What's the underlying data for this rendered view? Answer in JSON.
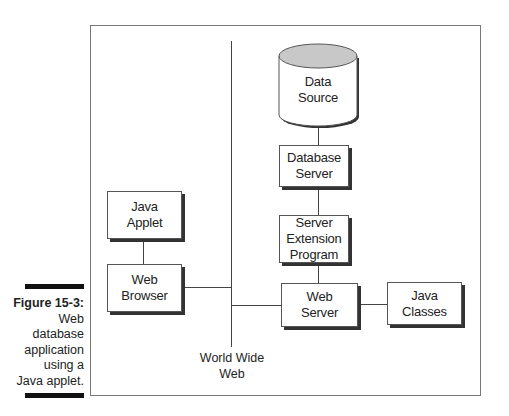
{
  "caption": {
    "label": "Figure 15-3:",
    "text": "Web\ndatabase\napplication\nusing a\nJava applet."
  },
  "diagram": {
    "nodes": {
      "data_source": "Data\nSource",
      "database_server": "Database\nServer",
      "server_extension": "Server\nExtension\nProgram",
      "java_applet": "Java\nApplet",
      "web_browser": "Web\nBrowser",
      "web_server": "Web\nServer",
      "java_classes": "Java\nClasses"
    },
    "www_label": "World Wide\nWeb",
    "connections": [
      [
        "data_source",
        "database_server"
      ],
      [
        "database_server",
        "server_extension"
      ],
      [
        "server_extension",
        "web_server"
      ],
      [
        "java_applet",
        "web_browser"
      ],
      [
        "web_browser",
        "world_wide_web"
      ],
      [
        "world_wide_web",
        "web_server"
      ],
      [
        "web_server",
        "java_classes"
      ]
    ],
    "colors": {
      "cylinder_top": "#c8c8c8",
      "stroke": "#444444",
      "shadow": "#333333"
    }
  }
}
